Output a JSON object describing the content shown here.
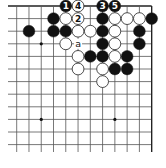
{
  "diagram": {
    "type": "go-board-fragment",
    "corner": "top-right",
    "grid": {
      "cols": 12,
      "rows": 12,
      "origin_x": 16.7,
      "origin_y": 6,
      "spacing_x": 12.27,
      "spacing_y": 12.6,
      "left_extend_to": 8,
      "bottom_extend_to": 152,
      "line_color": "#555555",
      "edge_color": "#222222"
    },
    "star_points": [
      {
        "col": 2,
        "row": 3
      },
      {
        "col": 2,
        "row": 9
      },
      {
        "col": 8,
        "row": 9
      }
    ],
    "stones": [
      {
        "col": 4,
        "row": 0,
        "color": "black",
        "label": "1"
      },
      {
        "col": 5,
        "row": 0,
        "color": "white",
        "label": "4"
      },
      {
        "col": 7,
        "row": 0,
        "color": "black",
        "label": "3"
      },
      {
        "col": 8,
        "row": 0,
        "color": "black",
        "label": "5"
      },
      {
        "col": 3,
        "row": 1,
        "color": "black",
        "label": ""
      },
      {
        "col": 4,
        "row": 1,
        "color": "white",
        "label": ""
      },
      {
        "col": 5,
        "row": 1,
        "color": "white",
        "label": "2"
      },
      {
        "col": 7,
        "row": 1,
        "color": "black",
        "label": ""
      },
      {
        "col": 8,
        "row": 1,
        "color": "white",
        "label": ""
      },
      {
        "col": 9,
        "row": 1,
        "color": "white",
        "label": ""
      },
      {
        "col": 10,
        "row": 1,
        "color": "white",
        "label": ""
      },
      {
        "col": 11,
        "row": 1,
        "color": "black",
        "label": ""
      },
      {
        "col": 1,
        "row": 2,
        "color": "black",
        "label": ""
      },
      {
        "col": 3,
        "row": 2,
        "color": "black",
        "label": ""
      },
      {
        "col": 4,
        "row": 2,
        "color": "black",
        "label": ""
      },
      {
        "col": 5,
        "row": 2,
        "color": "white",
        "label": ""
      },
      {
        "col": 6,
        "row": 2,
        "color": "white",
        "label": ""
      },
      {
        "col": 7,
        "row": 2,
        "color": "black",
        "label": ""
      },
      {
        "col": 8,
        "row": 2,
        "color": "white",
        "label": ""
      },
      {
        "col": 10,
        "row": 2,
        "color": "black",
        "label": ""
      },
      {
        "col": 4,
        "row": 3,
        "color": "white",
        "label": ""
      },
      {
        "col": 7,
        "row": 3,
        "color": "black",
        "label": ""
      },
      {
        "col": 8,
        "row": 3,
        "color": "white",
        "label": ""
      },
      {
        "col": 10,
        "row": 3,
        "color": "black",
        "label": ""
      },
      {
        "col": 5,
        "row": 4,
        "color": "white",
        "label": ""
      },
      {
        "col": 6,
        "row": 4,
        "color": "black",
        "label": ""
      },
      {
        "col": 7,
        "row": 4,
        "color": "black",
        "label": ""
      },
      {
        "col": 8,
        "row": 4,
        "color": "white",
        "label": ""
      },
      {
        "col": 9,
        "row": 4,
        "color": "black",
        "label": ""
      },
      {
        "col": 5,
        "row": 5,
        "color": "white",
        "label": ""
      },
      {
        "col": 7,
        "row": 5,
        "color": "white",
        "label": ""
      },
      {
        "col": 8,
        "row": 5,
        "color": "black",
        "label": ""
      },
      {
        "col": 9,
        "row": 5,
        "color": "black",
        "label": ""
      },
      {
        "col": 7,
        "row": 6,
        "color": "white",
        "label": ""
      }
    ],
    "markers": [
      {
        "col": 5,
        "row": 3,
        "label": "a"
      }
    ]
  }
}
